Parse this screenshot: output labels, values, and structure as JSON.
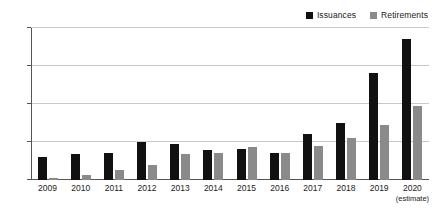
{
  "chart_data": {
    "type": "bar",
    "title": "",
    "subtitle": "",
    "xlabel": "",
    "ylabel": "",
    "categories": [
      "2009",
      "2010",
      "2011",
      "2012",
      "2013",
      "2014",
      "2015",
      "2016",
      "2017",
      "2018",
      "2019",
      "2020"
    ],
    "category_notes": [
      "",
      "",
      "",
      "",
      "",
      "",
      "",
      "",
      "",
      "",
      "",
      "(estimate)"
    ],
    "series": [
      {
        "name": "Issuances",
        "color": "#111111",
        "values": [
          30,
          34,
          36,
          50,
          47,
          40,
          41,
          36,
          61,
          75,
          141,
          185
        ]
      },
      {
        "name": "Retirements",
        "color": "#8a8a8a",
        "values": [
          2,
          6,
          13,
          20,
          34,
          35,
          44,
          36,
          45,
          55,
          73,
          97
        ]
      }
    ],
    "ylim": [
      0,
      200
    ],
    "yticks": [
      0,
      50,
      100,
      150,
      200
    ],
    "ytick_labels": [
      "0",
      "50",
      "100",
      "150",
      "200"
    ],
    "grid": true,
    "grid_axis": "y",
    "legend_position": "top-right"
  },
  "legend": {
    "entries": [
      {
        "label": "Issuances",
        "color": "#111111"
      },
      {
        "label": "Retirements",
        "color": "#8a8a8a"
      }
    ]
  },
  "colors": {
    "background": "#ffffff",
    "gridline": "#c8c8c8",
    "axis": "#555555",
    "text": "#1a1a1a"
  }
}
